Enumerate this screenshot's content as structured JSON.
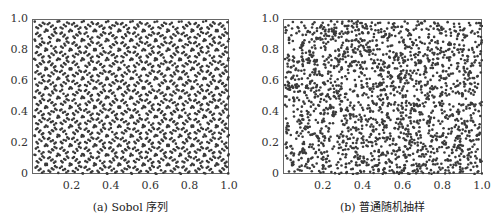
{
  "chart_data": [
    {
      "type": "scatter",
      "title": "(a) Sobol 序列",
      "caption": "(a) Sobol 序列",
      "xlabel": "",
      "ylabel": "",
      "xlim": [
        0,
        1.0
      ],
      "ylim": [
        0,
        1.0
      ],
      "x_ticks": [
        "0.2",
        "0.4",
        "0.6",
        "0.8",
        "1.0"
      ],
      "x_tick_values": [
        0.2,
        0.4,
        0.6,
        0.8,
        1.0
      ],
      "y_ticks": [
        "0",
        "0.2",
        "0.4",
        "0.6",
        "0.8",
        "1.0"
      ],
      "y_tick_values": [
        0,
        0.2,
        0.4,
        0.6,
        0.8,
        1.0
      ],
      "grid": false,
      "series": [
        {
          "name": "Sobol sequence samples",
          "generator": "sobol-2d",
          "n_points": 2000,
          "color": "#3a3a3a",
          "marker_size": 2.6
        }
      ],
      "description": "Low-discrepancy 2D Sobol points uniformly covering the unit square with regular diagonal lattice patterns"
    },
    {
      "type": "scatter",
      "title": "(b) 普通随机抽样",
      "caption": "(b) 普通随机抽样",
      "xlabel": "",
      "ylabel": "",
      "xlim": [
        0,
        1.0
      ],
      "ylim": [
        0,
        1.0
      ],
      "x_ticks": [
        "0.2",
        "0.4",
        "0.6",
        "0.8",
        "1.0"
      ],
      "x_tick_values": [
        0.2,
        0.4,
        0.6,
        0.8,
        1.0
      ],
      "y_ticks": [
        "0",
        "0.2",
        "0.4",
        "0.6",
        "0.8",
        "1.0"
      ],
      "y_tick_values": [
        0,
        0.2,
        0.4,
        0.6,
        0.8,
        1.0
      ],
      "grid": false,
      "series": [
        {
          "name": "Ordinary random samples",
          "generator": "uniform-random",
          "n_points": 2000,
          "color": "#3a3a3a",
          "marker_size": 2.6,
          "seed": 12345
        }
      ],
      "description": "Pseudo-random uniform 2D points with visible clustering and gaps"
    }
  ],
  "layout": {
    "panels": [
      {
        "box": {
          "left": 32,
          "top": 19,
          "width": 197,
          "height": 155
        }
      },
      {
        "box": {
          "left": 283,
          "top": 19,
          "width": 199,
          "height": 155
        }
      }
    ]
  }
}
